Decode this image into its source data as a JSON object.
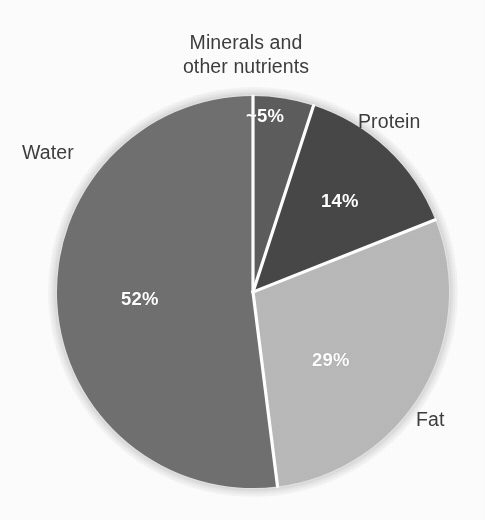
{
  "figure": {
    "background_color": "#fdfdfd",
    "label_color": "#3d3d3d",
    "value_color": "#ffffff",
    "separator_color": "#ffffff",
    "halo_color": "#e2e2e2"
  },
  "chart_data": {
    "type": "pie",
    "title": "",
    "subtitle": "",
    "xlabel": "",
    "ylabel": "",
    "grid": false,
    "legend_position": "outside-callout-labels",
    "units": "percent",
    "start_angle_deg": 0,
    "direction": "clockwise",
    "center_px": [
      253,
      292
    ],
    "radius_px": 196,
    "categories": [
      "Minerals and other nutrients",
      "Protein",
      "Fat",
      "Water"
    ],
    "values": [
      5,
      14,
      29,
      52
    ],
    "value_labels": [
      "~5%",
      "14%",
      "29%",
      "52%"
    ],
    "colors": [
      "#5d5d5d",
      "#474747",
      "#b9b9b9",
      "#6f6f6f"
    ],
    "slices": [
      {
        "name": "minerals",
        "label": "Minerals and\nother nutrients",
        "label_line1": "Minerals and",
        "label_line2": "other nutrients",
        "value": 5,
        "value_label": "~5%",
        "color": "#5d5d5d",
        "start_deg": 0,
        "end_deg": 18
      },
      {
        "name": "protein",
        "label": "Protein",
        "value": 14,
        "value_label": "14%",
        "color": "#474747",
        "start_deg": 18,
        "end_deg": 68.4
      },
      {
        "name": "fat",
        "label": "Fat",
        "value": 29,
        "value_label": "29%",
        "color": "#b9b9b9",
        "start_deg": 68.4,
        "end_deg": 172.8
      },
      {
        "name": "water",
        "label": "Water",
        "value": 52,
        "value_label": "52%",
        "color": "#6f6f6f",
        "start_deg": 172.8,
        "end_deg": 360
      }
    ]
  },
  "labels": {
    "minerals_line1": "Minerals and",
    "minerals_line2": "other nutrients",
    "water": "Water",
    "protein": "Protein",
    "fat": "Fat"
  },
  "values": {
    "minerals": "~5%",
    "protein": "14%",
    "fat": "29%",
    "water": "52%"
  }
}
